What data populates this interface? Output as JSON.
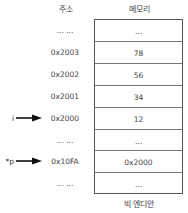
{
  "headers": {
    "address": "주소",
    "memory": "메모리"
  },
  "rows": [
    {
      "address": "... ...",
      "value": "..."
    },
    {
      "address": "0x2003",
      "value": "78"
    },
    {
      "address": "0x2002",
      "value": "56"
    },
    {
      "address": "0x2001",
      "value": "34"
    },
    {
      "address": "0x2000",
      "value": "12"
    },
    {
      "address": "... ...",
      "value": "..."
    },
    {
      "address": "0x10FA",
      "value": "0x2000"
    },
    {
      "address": "... ...",
      "value": "..."
    }
  ],
  "pointers": [
    {
      "label": "i",
      "row": 4
    },
    {
      "label": "*p",
      "row": 6
    }
  ],
  "caption": "빅 엔디안",
  "colors": {
    "border": "#555555",
    "arrow": "#111111",
    "text": "#444444"
  }
}
